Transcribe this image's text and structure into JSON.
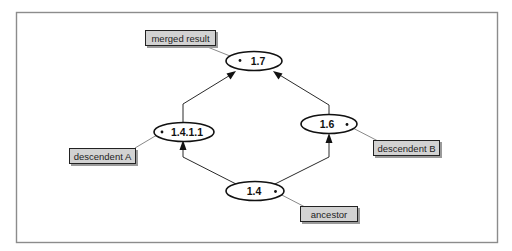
{
  "diagram": {
    "type": "revision-merge-graph",
    "nodes": [
      {
        "id": "n17",
        "label": "1.7",
        "role": "merged result"
      },
      {
        "id": "n1411",
        "label": "1.4.1.1",
        "role": "descendent A"
      },
      {
        "id": "n16",
        "label": "1.6",
        "role": "descendent B"
      },
      {
        "id": "n14",
        "label": "1.4",
        "role": "ancestor"
      }
    ],
    "edges": [
      {
        "from": "n14",
        "to": "n1411"
      },
      {
        "from": "n14",
        "to": "n16"
      },
      {
        "from": "n1411",
        "to": "n17"
      },
      {
        "from": "n16",
        "to": "n17"
      }
    ],
    "callouts": [
      {
        "text": "merged result",
        "target": "n17"
      },
      {
        "text": "descendent A",
        "target": "n1411"
      },
      {
        "text": "descendent B",
        "target": "n16"
      },
      {
        "text": "ancestor",
        "target": "n14"
      }
    ],
    "colors": {
      "label_fill": "#d2d2d2",
      "node_fill": "#ffffff",
      "stroke": "#111111"
    }
  }
}
